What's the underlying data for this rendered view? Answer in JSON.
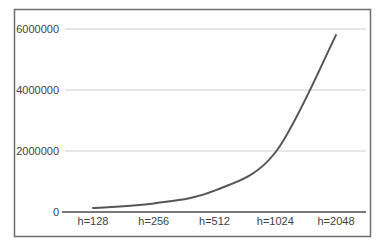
{
  "chart_data": {
    "type": "line",
    "title": "",
    "xlabel": "",
    "ylabel": "",
    "categories": [
      "h=128",
      "h=256",
      "h=512",
      "h=1024",
      "h=2048"
    ],
    "series": [
      {
        "name": "series-1",
        "values": [
          130000,
          280000,
          700000,
          1950000,
          5800000
        ]
      }
    ],
    "ylim": [
      0,
      6000000
    ],
    "y_ticks": [
      0,
      2000000,
      4000000,
      6000000
    ],
    "y_tick_labels": [
      "0",
      "2000000",
      "4000000",
      "6000000"
    ],
    "grid": "horizontal",
    "legend": "none",
    "marker": "none",
    "colors": {
      "line": "#565656",
      "grid": "#cfcfcf",
      "axis": "#4d4d4d",
      "text": "#3f3f3f",
      "frame_border": "#6e6e6e",
      "background": "#ffffff"
    }
  }
}
